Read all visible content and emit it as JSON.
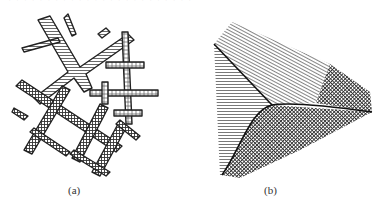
{
  "header": {
    "cut_text": "· · · · · · · · · · · · · · · · · · · · · · · ·"
  },
  "figures": [
    {
      "id": "a",
      "caption": "(a)",
      "description": "dendritic crystal branches with hatched fill"
    },
    {
      "id": "b",
      "caption": "(b)",
      "description": "three-domain wedge with hatched regions and boundary lines"
    }
  ],
  "colors": {
    "ink": "#222222",
    "hatch": "#555555",
    "background": "#ffffff"
  }
}
